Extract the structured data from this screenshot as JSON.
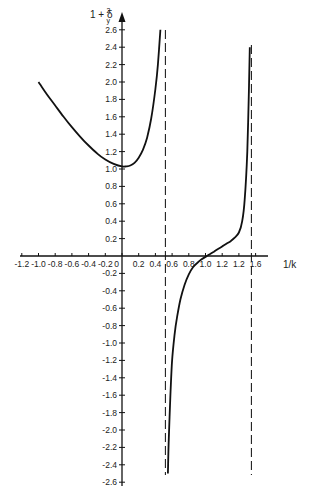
{
  "chart_data": {
    "type": "line",
    "title": "",
    "xlabel": "1/k",
    "ylabel": "1 + δy²",
    "ylabel_main": "1 + δ",
    "ylabel_sup": "2",
    "ylabel_sub": "y",
    "xlim": [
      -1.2,
      1.7
    ],
    "ylim": [
      -2.6,
      2.6
    ],
    "grid": false,
    "legend": null,
    "x_ticks": [
      {
        "value": -1.2,
        "label": "-1.2"
      },
      {
        "value": -1.0,
        "label": "-1.0"
      },
      {
        "value": -0.8,
        "label": "-0.8"
      },
      {
        "value": -0.6,
        "label": "-0.6"
      },
      {
        "value": -0.4,
        "label": "-0.4"
      },
      {
        "value": -0.2,
        "label": "-0.2"
      },
      {
        "value": 0.0,
        "label": "0"
      },
      {
        "value": 0.2,
        "label": "0.2"
      },
      {
        "value": 0.4,
        "label": "0.4"
      },
      {
        "value": 0.6,
        "label": "0.6"
      },
      {
        "value": 0.8,
        "label": "0.8"
      },
      {
        "value": 1.0,
        "label": "1.0"
      },
      {
        "value": 1.2,
        "label": "1.2"
      },
      {
        "value": 1.4,
        "label": "1.2"
      },
      {
        "value": 1.6,
        "label": "1.6"
      }
    ],
    "y_ticks": [
      {
        "value": 2.6,
        "label": "2.6"
      },
      {
        "value": 2.4,
        "label": "2.4"
      },
      {
        "value": 2.2,
        "label": "2.2"
      },
      {
        "value": 2.0,
        "label": "2.0"
      },
      {
        "value": 1.8,
        "label": "1.8"
      },
      {
        "value": 1.6,
        "label": "1.6"
      },
      {
        "value": 1.4,
        "label": "1.4"
      },
      {
        "value": 1.2,
        "label": "1.2"
      },
      {
        "value": 1.0,
        "label": "1.0"
      },
      {
        "value": 0.8,
        "label": "0.8"
      },
      {
        "value": 0.6,
        "label": "0.6"
      },
      {
        "value": 0.4,
        "label": "0.4"
      },
      {
        "value": 0.2,
        "label": "0.2"
      },
      {
        "value": -0.2,
        "label": "-0.2"
      },
      {
        "value": -0.4,
        "label": "-0.4"
      },
      {
        "value": -0.6,
        "label": "-0.6"
      },
      {
        "value": -0.8,
        "label": "-0.8"
      },
      {
        "value": -1.0,
        "label": "-1.0"
      },
      {
        "value": -1.2,
        "label": "-1.2"
      },
      {
        "value": -1.4,
        "label": "-1.4"
      },
      {
        "value": -1.6,
        "label": "-1.6"
      },
      {
        "value": -1.8,
        "label": "-1.8"
      },
      {
        "value": -2.0,
        "label": "-2.0"
      },
      {
        "value": -2.2,
        "label": "-2.2"
      },
      {
        "value": -2.4,
        "label": "-2.4"
      },
      {
        "value": -2.6,
        "label": "-2.6"
      }
    ],
    "asymptotes_x": [
      0.52,
      1.55
    ],
    "series": [
      {
        "name": "branch-left",
        "x": [
          -1.0,
          -0.9,
          -0.8,
          -0.7,
          -0.6,
          -0.5,
          -0.4,
          -0.3,
          -0.2,
          -0.1,
          0.0,
          0.05,
          0.1,
          0.15,
          0.2,
          0.25,
          0.3,
          0.35,
          0.4,
          0.43,
          0.46
        ],
        "y": [
          2.0,
          1.86,
          1.73,
          1.6,
          1.48,
          1.37,
          1.27,
          1.18,
          1.11,
          1.06,
          1.03,
          1.03,
          1.04,
          1.07,
          1.13,
          1.22,
          1.36,
          1.58,
          1.92,
          2.2,
          2.6
        ]
      },
      {
        "name": "branch-right",
        "x": [
          0.55,
          0.56,
          0.58,
          0.6,
          0.63,
          0.66,
          0.7,
          0.75,
          0.8,
          0.85,
          0.9,
          0.95,
          1.0,
          1.05,
          1.1,
          1.15,
          1.2,
          1.25,
          1.3,
          1.35,
          1.4,
          1.44,
          1.47,
          1.5,
          1.52,
          1.53
        ],
        "y": [
          -2.5,
          -2.1,
          -1.6,
          -1.2,
          -0.9,
          -0.7,
          -0.5,
          -0.33,
          -0.21,
          -0.13,
          -0.08,
          -0.04,
          -0.01,
          0.02,
          0.05,
          0.08,
          0.11,
          0.14,
          0.17,
          0.21,
          0.27,
          0.4,
          0.65,
          1.2,
          1.9,
          2.4
        ]
      }
    ]
  }
}
